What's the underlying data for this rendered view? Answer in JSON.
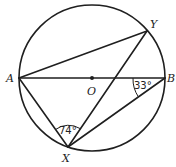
{
  "diagram": {
    "type": "circle-geometry",
    "circle": {
      "center": "O",
      "cx": 92,
      "cy": 78,
      "r": 73
    },
    "points": {
      "A": {
        "label": "A",
        "x": 19,
        "y": 78
      },
      "B": {
        "label": "B",
        "x": 165,
        "y": 78
      },
      "O": {
        "label": "O",
        "x": 92,
        "y": 78
      },
      "Y": {
        "label": "Y",
        "x": 147,
        "y": 31
      },
      "X": {
        "label": "X",
        "x": 68,
        "y": 147
      }
    },
    "segments": [
      "AB",
      "AY",
      "AX",
      "XY",
      "XB"
    ],
    "angles": {
      "AXY": {
        "label": "74°",
        "vertex": "X"
      },
      "ABX": {
        "label": "33°",
        "vertex": "B"
      }
    },
    "stroke_color": "#1f1f1f"
  }
}
